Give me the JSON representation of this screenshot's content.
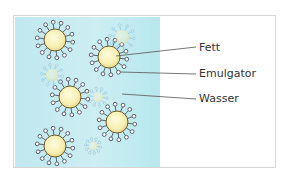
{
  "diagram": {
    "type": "emulsion-illustration",
    "labels": [
      {
        "id": "fett",
        "text": "Fett"
      },
      {
        "id": "emulgator",
        "text": "Emulgator"
      },
      {
        "id": "wasser",
        "text": "Wasser"
      }
    ],
    "colors": {
      "water": "#c6ecf2",
      "fat_droplet": "#f7efb0",
      "droplet_outline": "#6b5a2a",
      "emulsifier": "#4a5566",
      "leader_line": "#555555",
      "frame": "#d6d6d6"
    },
    "droplets": [
      {
        "cx": 55,
        "cy": 40,
        "r": 11,
        "faded": false
      },
      {
        "cx": 109,
        "cy": 57,
        "r": 11,
        "faded": false
      },
      {
        "cx": 70,
        "cy": 97,
        "r": 11,
        "faded": false
      },
      {
        "cx": 117,
        "cy": 122,
        "r": 11,
        "faded": false
      },
      {
        "cx": 55,
        "cy": 146,
        "r": 11,
        "faded": false
      },
      {
        "cx": 122,
        "cy": 37,
        "r": 7,
        "faded": true
      },
      {
        "cx": 52,
        "cy": 75,
        "r": 6,
        "faded": true
      },
      {
        "cx": 98,
        "cy": 97,
        "r": 5,
        "faded": true
      },
      {
        "cx": 93,
        "cy": 146,
        "r": 4,
        "faded": true
      }
    ]
  }
}
